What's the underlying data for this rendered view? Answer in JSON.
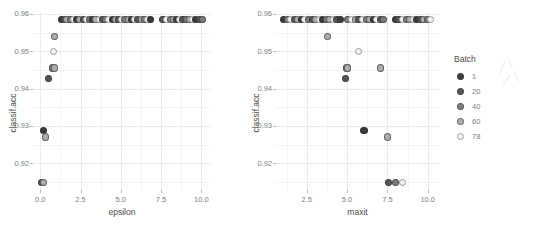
{
  "figure": {
    "background": "#ffffff",
    "grid_major_color": "#ebebeb",
    "grid_minor_color": "#f4f4f4",
    "axis_text_color": "#7d7d7d",
    "axis_title_color": "#4a4a4a"
  },
  "legend": {
    "title": "Batch",
    "position": "right",
    "items": [
      {
        "label": "1",
        "color": "#3b3b3b"
      },
      {
        "label": "20",
        "color": "#565656"
      },
      {
        "label": "40",
        "color": "#7e7e7e"
      },
      {
        "label": "60",
        "color": "#aeaeae"
      },
      {
        "label": "78",
        "color": "#f2f2f2"
      }
    ]
  },
  "chart_data": [
    {
      "type": "scatter",
      "title": "",
      "xlabel": "epsilon",
      "ylabel": "classif.acc",
      "xlim": [
        -0.45,
        10.6
      ],
      "ylim": [
        0.9128,
        0.9605
      ],
      "xticks": [
        0.0,
        2.5,
        5.0,
        7.5,
        10.0
      ],
      "xticklabels": [
        "0.0",
        "2.5",
        "5.0",
        "7.5",
        "10.0"
      ],
      "yticks": [
        0.92,
        0.93,
        0.94,
        0.95,
        0.96
      ],
      "yticklabels": [
        "0.92",
        "0.93",
        "0.94",
        "0.95",
        "0.96"
      ],
      "grid": true,
      "legend_key": "Batch",
      "points": [
        {
          "x": 0.1,
          "y": 0.9148,
          "batch": 20
        },
        {
          "x": 0.22,
          "y": 0.9148,
          "batch": 60
        },
        {
          "x": 0.18,
          "y": 0.9288,
          "batch": 1
        },
        {
          "x": 0.32,
          "y": 0.927,
          "batch": 60
        },
        {
          "x": 0.52,
          "y": 0.9428,
          "batch": 20
        },
        {
          "x": 0.75,
          "y": 0.9455,
          "batch": 40
        },
        {
          "x": 0.88,
          "y": 0.9455,
          "batch": 60
        },
        {
          "x": 0.82,
          "y": 0.95,
          "batch": 78
        },
        {
          "x": 0.9,
          "y": 0.954,
          "batch": 60
        },
        {
          "x": 1.3,
          "y": 0.9585,
          "batch": 1
        },
        {
          "x": 1.48,
          "y": 0.9585,
          "batch": 20
        },
        {
          "x": 1.66,
          "y": 0.9585,
          "batch": 60
        },
        {
          "x": 1.86,
          "y": 0.9585,
          "batch": 40
        },
        {
          "x": 2.06,
          "y": 0.9585,
          "batch": 78
        },
        {
          "x": 2.26,
          "y": 0.9585,
          "batch": 1
        },
        {
          "x": 2.46,
          "y": 0.9585,
          "batch": 60
        },
        {
          "x": 2.66,
          "y": 0.9585,
          "batch": 20
        },
        {
          "x": 2.86,
          "y": 0.9585,
          "batch": 78
        },
        {
          "x": 3.06,
          "y": 0.9585,
          "batch": 40
        },
        {
          "x": 3.26,
          "y": 0.9585,
          "batch": 1
        },
        {
          "x": 3.46,
          "y": 0.9585,
          "batch": 60
        },
        {
          "x": 3.66,
          "y": 0.9585,
          "batch": 78
        },
        {
          "x": 3.86,
          "y": 0.9585,
          "batch": 20
        },
        {
          "x": 4.06,
          "y": 0.9585,
          "batch": 40
        },
        {
          "x": 4.26,
          "y": 0.9585,
          "batch": 78
        },
        {
          "x": 4.46,
          "y": 0.9585,
          "batch": 1
        },
        {
          "x": 4.66,
          "y": 0.9585,
          "batch": 60
        },
        {
          "x": 4.86,
          "y": 0.9585,
          "batch": 20
        },
        {
          "x": 5.06,
          "y": 0.9585,
          "batch": 78
        },
        {
          "x": 5.26,
          "y": 0.9585,
          "batch": 40
        },
        {
          "x": 5.46,
          "y": 0.9585,
          "batch": 60
        },
        {
          "x": 5.66,
          "y": 0.9585,
          "batch": 1
        },
        {
          "x": 5.86,
          "y": 0.9585,
          "batch": 78
        },
        {
          "x": 6.06,
          "y": 0.9585,
          "batch": 20
        },
        {
          "x": 6.26,
          "y": 0.9585,
          "batch": 60
        },
        {
          "x": 6.46,
          "y": 0.9585,
          "batch": 40
        },
        {
          "x": 6.66,
          "y": 0.9585,
          "batch": 78
        },
        {
          "x": 6.86,
          "y": 0.9585,
          "batch": 1
        },
        {
          "x": 7.62,
          "y": 0.9585,
          "batch": 20
        },
        {
          "x": 7.84,
          "y": 0.9585,
          "batch": 78
        },
        {
          "x": 8.06,
          "y": 0.9585,
          "batch": 40
        },
        {
          "x": 8.26,
          "y": 0.9585,
          "batch": 60
        },
        {
          "x": 8.46,
          "y": 0.9585,
          "batch": 1
        },
        {
          "x": 8.66,
          "y": 0.9585,
          "batch": 78
        },
        {
          "x": 8.86,
          "y": 0.9585,
          "batch": 20
        },
        {
          "x": 9.06,
          "y": 0.9585,
          "batch": 40
        },
        {
          "x": 9.26,
          "y": 0.9585,
          "batch": 60
        },
        {
          "x": 9.46,
          "y": 0.9585,
          "batch": 78
        },
        {
          "x": 9.66,
          "y": 0.9585,
          "batch": 1
        },
        {
          "x": 9.86,
          "y": 0.9585,
          "batch": 20
        },
        {
          "x": 10.06,
          "y": 0.9585,
          "batch": 40
        }
      ]
    },
    {
      "type": "scatter",
      "title": "",
      "xlabel": "maxit",
      "ylabel": "classif.acc",
      "xlim": [
        0.6,
        10.7
      ],
      "ylim": [
        0.9128,
        0.9605
      ],
      "xticks": [
        2.5,
        5.0,
        7.5,
        10.0
      ],
      "xticklabels": [
        "2.5",
        "5.0",
        "7.5",
        "10.0"
      ],
      "yticks": [
        0.92,
        0.93,
        0.94,
        0.95,
        0.96
      ],
      "yticklabels": [
        "0.92",
        "0.93",
        "0.94",
        "0.95",
        "0.96"
      ],
      "grid": true,
      "legend_key": "Batch",
      "points": [
        {
          "x": 7.55,
          "y": 0.9148,
          "batch": 20
        },
        {
          "x": 8.0,
          "y": 0.9148,
          "batch": 40
        },
        {
          "x": 8.45,
          "y": 0.9148,
          "batch": 78
        },
        {
          "x": 7.5,
          "y": 0.927,
          "batch": 60
        },
        {
          "x": 6.05,
          "y": 0.9288,
          "batch": 1
        },
        {
          "x": 4.92,
          "y": 0.9428,
          "batch": 20
        },
        {
          "x": 5.0,
          "y": 0.9455,
          "batch": 40
        },
        {
          "x": 5.05,
          "y": 0.9455,
          "batch": 60
        },
        {
          "x": 7.05,
          "y": 0.9455,
          "batch": 60
        },
        {
          "x": 5.72,
          "y": 0.95,
          "batch": 78
        },
        {
          "x": 3.8,
          "y": 0.954,
          "batch": 60
        },
        {
          "x": 1.08,
          "y": 0.9585,
          "batch": 1
        },
        {
          "x": 1.3,
          "y": 0.9585,
          "batch": 40
        },
        {
          "x": 1.52,
          "y": 0.9585,
          "batch": 78
        },
        {
          "x": 1.74,
          "y": 0.9585,
          "batch": 20
        },
        {
          "x": 1.96,
          "y": 0.9585,
          "batch": 60
        },
        {
          "x": 2.18,
          "y": 0.9585,
          "batch": 1
        },
        {
          "x": 2.4,
          "y": 0.9585,
          "batch": 78
        },
        {
          "x": 2.62,
          "y": 0.9585,
          "batch": 40
        },
        {
          "x": 2.84,
          "y": 0.9585,
          "batch": 20
        },
        {
          "x": 3.06,
          "y": 0.9585,
          "batch": 60
        },
        {
          "x": 3.28,
          "y": 0.9585,
          "batch": 78
        },
        {
          "x": 3.5,
          "y": 0.9585,
          "batch": 1
        },
        {
          "x": 3.72,
          "y": 0.9585,
          "batch": 40
        },
        {
          "x": 3.94,
          "y": 0.9585,
          "batch": 60
        },
        {
          "x": 4.16,
          "y": 0.9585,
          "batch": 78
        },
        {
          "x": 4.38,
          "y": 0.9585,
          "batch": 20
        },
        {
          "x": 4.6,
          "y": 0.9585,
          "batch": 1
        },
        {
          "x": 5.05,
          "y": 0.9585,
          "batch": 40
        },
        {
          "x": 5.3,
          "y": 0.9585,
          "batch": 78
        },
        {
          "x": 5.52,
          "y": 0.9585,
          "batch": 60
        },
        {
          "x": 5.74,
          "y": 0.9585,
          "batch": 20
        },
        {
          "x": 5.96,
          "y": 0.9585,
          "batch": 78
        },
        {
          "x": 6.18,
          "y": 0.9585,
          "batch": 40
        },
        {
          "x": 6.4,
          "y": 0.9585,
          "batch": 60
        },
        {
          "x": 6.62,
          "y": 0.9585,
          "batch": 1
        },
        {
          "x": 6.84,
          "y": 0.9585,
          "batch": 78
        },
        {
          "x": 7.06,
          "y": 0.9585,
          "batch": 20
        },
        {
          "x": 7.28,
          "y": 0.9585,
          "batch": 40
        },
        {
          "x": 8.0,
          "y": 0.9585,
          "batch": 1
        },
        {
          "x": 8.22,
          "y": 0.9585,
          "batch": 20
        },
        {
          "x": 8.44,
          "y": 0.9585,
          "batch": 78
        },
        {
          "x": 8.66,
          "y": 0.9585,
          "batch": 40
        },
        {
          "x": 8.88,
          "y": 0.9585,
          "batch": 60
        },
        {
          "x": 9.1,
          "y": 0.9585,
          "batch": 78
        },
        {
          "x": 9.32,
          "y": 0.9585,
          "batch": 1
        },
        {
          "x": 9.54,
          "y": 0.9585,
          "batch": 20
        },
        {
          "x": 9.76,
          "y": 0.9585,
          "batch": 60
        },
        {
          "x": 9.98,
          "y": 0.9585,
          "batch": 40
        },
        {
          "x": 10.2,
          "y": 0.9585,
          "batch": 78
        }
      ]
    }
  ]
}
